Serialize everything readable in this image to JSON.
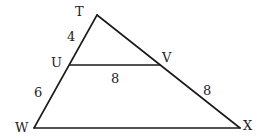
{
  "diagram": {
    "type": "triangle-with-parallel-segment",
    "colors": {
      "stroke": "#1a1a1a",
      "text": "#222222",
      "background": "#ffffff"
    },
    "vertices": {
      "T": {
        "label": "T",
        "x": 97,
        "y": 15
      },
      "U": {
        "label": "U",
        "x": 70,
        "y": 65
      },
      "V": {
        "label": "V",
        "x": 160,
        "y": 65
      },
      "W": {
        "label": "W",
        "x": 34,
        "y": 128
      },
      "X": {
        "label": "X",
        "x": 240,
        "y": 128
      }
    },
    "segment_labels": {
      "TU": "4",
      "UW": "6",
      "UV": "8",
      "VX": "8"
    }
  }
}
